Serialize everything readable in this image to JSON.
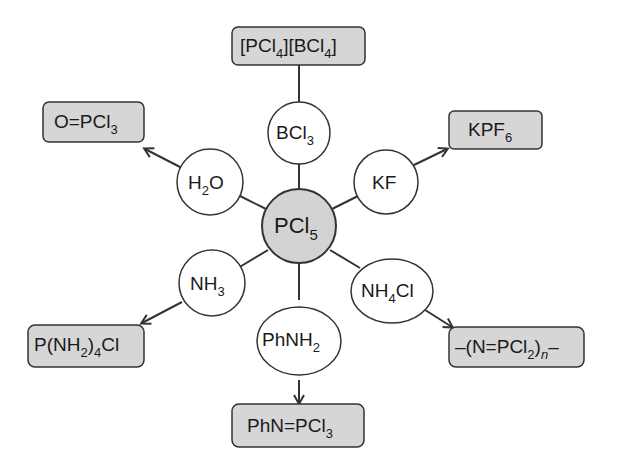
{
  "center": {
    "label": "PCl",
    "sub": "5",
    "fill": "#d3d3d3"
  },
  "reagents": [
    {
      "id": "bcl3",
      "label": "BCl",
      "sub": "3"
    },
    {
      "id": "kf",
      "label": "KF",
      "sub": ""
    },
    {
      "id": "nh4cl",
      "label": "NH",
      "sub": "4",
      "tail": "Cl"
    },
    {
      "id": "phnh2",
      "label": "PhNH",
      "sub": "2"
    },
    {
      "id": "nh3",
      "label": "NH",
      "sub": "3"
    },
    {
      "id": "h2o",
      "label": "H",
      "sub": "2",
      "tail": "O"
    }
  ],
  "products": [
    {
      "id": "pcl4bcl4",
      "p1": "[PCl",
      "s1": "4",
      "p2": "][BCl",
      "s2": "4",
      "p3": "]"
    },
    {
      "id": "kpf6",
      "p1": "KPF",
      "s1": "6"
    },
    {
      "id": "polymer",
      "p1": "–(N=PCl",
      "s1": "2",
      "p2": ")",
      "s2": "n",
      "p3": "–"
    },
    {
      "id": "phnpcl3",
      "p1": "PhN=PCl",
      "s1": "3"
    },
    {
      "id": "pnh24cl",
      "p1": "P(NH",
      "s1": "2",
      "p2": ")",
      "s2": "4",
      "p3": "Cl"
    },
    {
      "id": "opcl3",
      "p1": "O=PCl",
      "s1": "3"
    }
  ],
  "colors": {
    "product_fill": "#d6d6d6",
    "stroke": "#333333",
    "reagent_fill": "#ffffff"
  }
}
